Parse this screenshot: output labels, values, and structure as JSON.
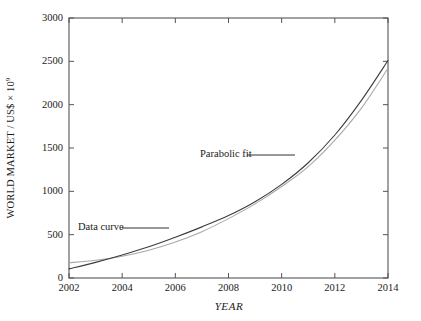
{
  "chart_data": {
    "type": "line",
    "title": "",
    "xlabel": "YEAR",
    "ylabel": "WORLD MARKET / US$ × 10",
    "ylabel_exponent": "9",
    "xlim": [
      2002,
      2014
    ],
    "ylim": [
      0,
      3000
    ],
    "grid": false,
    "legend_position": "inline-annotations",
    "xticks": [
      2002,
      2004,
      2006,
      2008,
      2010,
      2012,
      2014
    ],
    "xtick_labels": [
      "2002",
      "2004",
      "2006",
      "2008",
      "2010",
      "2012",
      "2014"
    ],
    "yticks": [
      0,
      500,
      1000,
      1500,
      2000,
      2500,
      3000
    ],
    "ytick_labels": [
      "0",
      "500",
      "1000",
      "1500",
      "2000",
      "2500",
      "3000"
    ],
    "x": [
      2002,
      2003,
      2004,
      2005,
      2006,
      2007,
      2008,
      2009,
      2010,
      2011,
      2012,
      2013,
      2014
    ],
    "series": [
      {
        "name": "Data curve",
        "color": "#3c3c3c",
        "values": [
          105,
          180,
          265,
          360,
          470,
          590,
          720,
          880,
          1080,
          1330,
          1650,
          2050,
          2510
        ]
      },
      {
        "name": "Parabolic fit",
        "color": "#a8a8a8",
        "values": [
          175,
          205,
          250,
          320,
          415,
          535,
          685,
          855,
          1055,
          1285,
          1590,
          1960,
          2420
        ]
      }
    ],
    "annotations": [
      {
        "text": "Data curve",
        "text_x": 78,
        "text_y": 228,
        "leader_from_x": 122,
        "leader_from_y": 228,
        "leader_to_x": 169,
        "leader_to_y": 228
      },
      {
        "text": "Parabolic fit",
        "text_x": 200,
        "text_y": 155,
        "leader_from_x": 247,
        "leader_from_y": 155,
        "leader_to_x": 295,
        "leader_to_y": 155
      }
    ]
  },
  "plot_frame": {
    "left": 69,
    "right": 388,
    "top": 18,
    "bottom": 278,
    "frame_color": "#555555",
    "tick_length": 5
  },
  "colors": {
    "background": "#ffffff",
    "axis": "#555555",
    "text": "#1a1a1a",
    "data_curve": "#3c3c3c",
    "parabolic_fit": "#a8a8a8"
  }
}
